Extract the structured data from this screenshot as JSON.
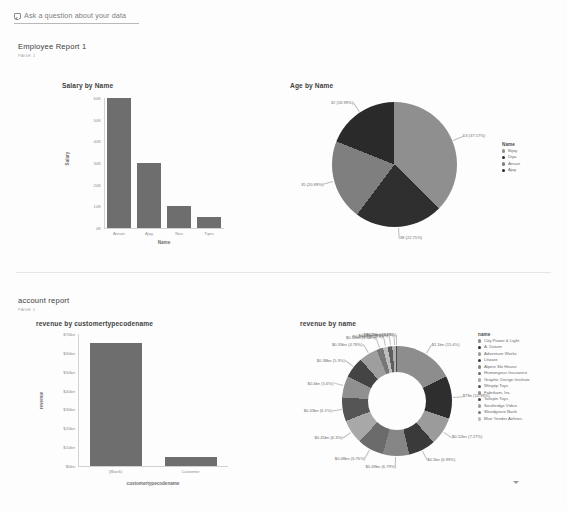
{
  "qna": {
    "placeholder": "Ask a question about your data",
    "icon": "qna-box-icon"
  },
  "reports": [
    {
      "title": "Employee Report 1",
      "page": "PAGE 1"
    },
    {
      "title": "account report",
      "page": "PAGE 1"
    }
  ],
  "colors": {
    "bar": "#6e6e6e",
    "slice_dark": "#2f2f2f",
    "slice_mid": "#7a7a7a",
    "slice_light": "#a3a3a3",
    "axis": "#8d8d8d",
    "divider": "#e6e6e6"
  },
  "chart_data": [
    {
      "id": "salary-by-name",
      "type": "bar",
      "title": "Salary by Name",
      "xlabel": "Name",
      "ylabel": "Salary",
      "categories": [
        "Ansari",
        "Ajay",
        "Nav",
        "Tipru"
      ],
      "values": [
        60000,
        30000,
        10000,
        5000
      ],
      "ylim": [
        0,
        60000
      ],
      "yticks": [
        "0K",
        "10K",
        "20K",
        "30K",
        "40K",
        "50K",
        "60K"
      ],
      "ytick_values": [
        0,
        10000,
        20000,
        30000,
        40000,
        50000,
        60000
      ],
      "grid": false,
      "legend": "none"
    },
    {
      "id": "age-by-name",
      "type": "pie",
      "title": "Age by Name",
      "legend_title": "Name",
      "legend_position": "right",
      "slices": [
        {
          "label": "Bijoy",
          "value": 63,
          "percent": 37.57,
          "data_label": "63 (37.57%)",
          "color": "#8f8f8f"
        },
        {
          "label": "Diya",
          "value": 38,
          "percent": 22.75,
          "data_label": "38 (22.75%)",
          "color": "#2f2f2f"
        },
        {
          "label": "Ansari",
          "value": 35,
          "percent": 20.89,
          "data_label": "35 (20.89%)",
          "color": "#7f7f7f"
        },
        {
          "label": "Ajay",
          "value": 32,
          "percent": 18.99,
          "data_label": "32 (18.99%)",
          "color": "#2a2a2a"
        }
      ]
    },
    {
      "id": "revenue-by-customertypecodename",
      "type": "bar",
      "title": "revenue by customertypecodename",
      "xlabel": "customertypecodename",
      "ylabel": "revenue",
      "categories": [
        "(Blank)",
        "Customer"
      ],
      "values": [
        65,
        5
      ],
      "ylim": [
        0,
        70
      ],
      "yticks": [
        "$0bn",
        "$10bn",
        "$20bn",
        "$30bn",
        "$40bn",
        "$50bn",
        "$60bn",
        "$70bn"
      ],
      "ytick_values": [
        0,
        10,
        20,
        30,
        40,
        50,
        60,
        70
      ],
      "grid": false,
      "legend": "none"
    },
    {
      "id": "revenue-by-name",
      "type": "pie",
      "title": "revenue by name",
      "legend_title": "name",
      "legend_position": "right",
      "donut": true,
      "slices": [
        {
          "label": "City Power & Light",
          "value": 1.1,
          "percent": 15.4,
          "data_label": "$1.1bn (15.4%)",
          "color": "#8d8d8d"
        },
        {
          "label": "A. Datum",
          "value": 0.78,
          "percent": 10.99,
          "data_label": "$78n (10.99%)",
          "color": "#2e2e2e"
        },
        {
          "label": "Adventure Works",
          "value": 0.52,
          "percent": 7.27,
          "data_label": "$0.52bn (7.27%)",
          "color": "#9b9b9b"
        },
        {
          "label": "Litware",
          "value": 0.5,
          "percent": 6.99,
          "data_label": "$0.5bn (6.99%)",
          "color": "#3a3a3a"
        },
        {
          "label": "Alpine Ski House",
          "value": 0.49,
          "percent": 6.79,
          "data_label": "$0.49bn (6.79%)",
          "color": "#868686"
        },
        {
          "label": "Humongous Insurance",
          "value": 0.48,
          "percent": 6.76,
          "data_label": "$0.48bn (6.76%)",
          "color": "#6b6b6b"
        },
        {
          "label": "Graphic Design Institute",
          "value": 0.45,
          "percent": 6.3,
          "data_label": "$0.45bn (6.3%)",
          "color": "#a8a8a8"
        },
        {
          "label": "Wingtip Toys",
          "value": 0.43,
          "percent": 6.1,
          "data_label": "$0.43bn (6.1%)",
          "color": "#555555"
        },
        {
          "label": "Fabrikam, Inc.",
          "value": 0.4,
          "percent": 5.6,
          "data_label": "$0.4bn (5.6%)",
          "color": "#909090"
        },
        {
          "label": "Tailspin Toys",
          "value": 0.38,
          "percent": 5.3,
          "data_label": "$0.38bn (5.3%)",
          "color": "#444444"
        },
        {
          "label": "Southridge Video",
          "value": 0.33,
          "percent": 4.78,
          "data_label": "$0.33bn (4.78%)",
          "color": "#9e9e9e"
        },
        {
          "label": "Woodgrove Bank",
          "value": 0.12,
          "percent": 1.68,
          "data_label": "$0.12bn (1.68%)",
          "color": "#777777"
        },
        {
          "label": "Blue Yonder Airlines",
          "value": 0.09,
          "percent": 1.25,
          "data_label": "$0.09bn (1.25%)",
          "color": "#bdbdbd"
        },
        {
          "label": "",
          "value": 0.08,
          "percent": 1.15,
          "data_label": "$0.08bn (1.15%)",
          "color": "#5e5e5e"
        },
        {
          "label": "",
          "value": 0.07,
          "percent": 0.94,
          "data_label": "$0.07bn (0.94%)",
          "color": "#b0b0b0"
        },
        {
          "label": "",
          "value": 0.03,
          "percent": 0.29,
          "data_label": "$0.03bn (0.29%)",
          "color": "#4a4a4a"
        }
      ]
    }
  ],
  "scroll": {
    "chevron": "chevron-down-icon"
  }
}
